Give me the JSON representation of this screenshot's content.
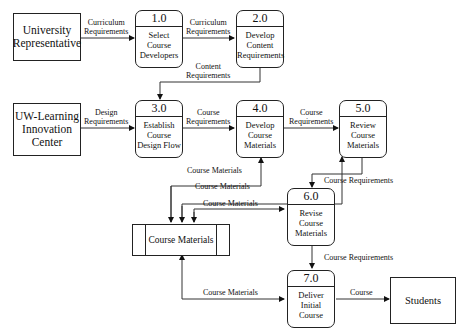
{
  "entities": {
    "university": "University Representative",
    "university_l1": "University",
    "university_l2": "Representative",
    "uwl_l1": "UW-Learning",
    "uwl_l2": "Innovation",
    "uwl_l3": "Center",
    "students": "Students"
  },
  "processes": [
    {
      "num": "1.0",
      "l1": "Select",
      "l2": "Course",
      "l3": "Developers"
    },
    {
      "num": "2.0",
      "l1": "Develop",
      "l2": "Content",
      "l3": "Requirements"
    },
    {
      "num": "3.0",
      "l1": "Establish",
      "l2": "Course",
      "l3": "Design Flow"
    },
    {
      "num": "4.0",
      "l1": "Develop",
      "l2": "Course",
      "l3": "Materials"
    },
    {
      "num": "5.0",
      "l1": "Review",
      "l2": "Course",
      "l3": "Materials"
    },
    {
      "num": "6.0",
      "l1": "Revise",
      "l2": "Course",
      "l3": "Materials"
    },
    {
      "num": "7.0",
      "l1": "Deliver",
      "l2": "Initial",
      "l3": "Course"
    }
  ],
  "store": {
    "label": "Course Materials"
  },
  "flows": {
    "f1_l1": "Curriculum",
    "f1_l2": "Requirements",
    "f2_l1": "Curriculum",
    "f2_l2": "Requirements",
    "f3_l1": "Content",
    "f3_l2": "Requirements",
    "f4_l1": "Design",
    "f4_l2": "Requirements",
    "f5_l1": "Course",
    "f5_l2": "Requirements",
    "f6_l1": "Course",
    "f6_l2": "Requirements",
    "f7": "Course Materials",
    "f8": "Course Materials",
    "f9": "Course Materials",
    "f10": "Course Requirements",
    "f11": "Course Requirements",
    "f12": "Course Materials",
    "f13": "Course"
  }
}
